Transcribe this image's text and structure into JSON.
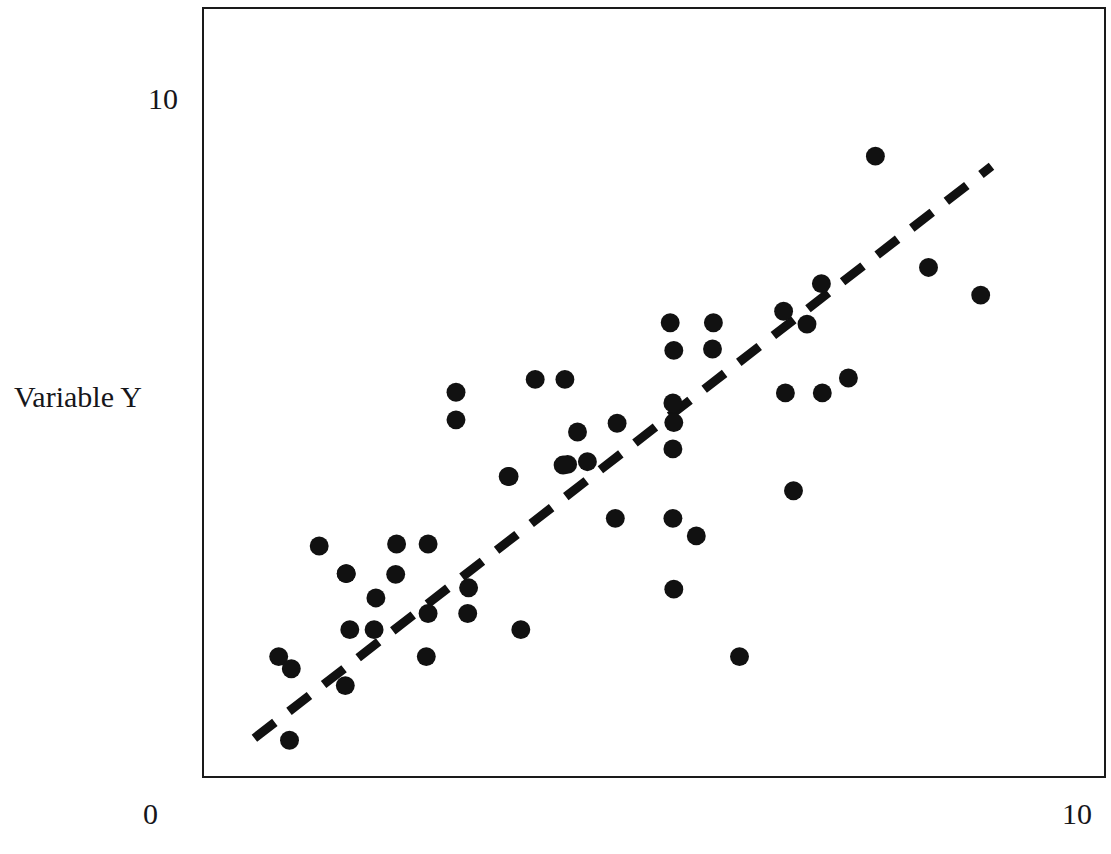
{
  "axes": {
    "y_label": "Variable Y",
    "y_tick_top": "10",
    "x_tick_left": "0",
    "x_tick_right": "10"
  },
  "style": {
    "point_color": "#111111",
    "line_color": "#111111",
    "frame_color": "#1a1a1a",
    "background": "#ffffff",
    "point_radius_px": 9.5,
    "trend_dash": "26 18",
    "trend_width_px": 9
  },
  "chart_data": {
    "type": "scatter",
    "title": "",
    "xlabel": "",
    "ylabel": "Variable Y",
    "xlim": [
      0,
      10
    ],
    "ylim": [
      0,
      10
    ],
    "xticks": [
      0,
      10
    ],
    "yticks": [
      10
    ],
    "grid": false,
    "legend": null,
    "frame": {
      "left_px": 202,
      "top_px": 7,
      "width_px": 904,
      "height_px": 771
    },
    "pixel_mapping": {
      "x0_px": 202,
      "x_per_unit_px": 90.4,
      "y0_px": 778,
      "y_per_unit_px": 67.8
    },
    "points": [
      {
        "x": 0.83,
        "y": 1.77
      },
      {
        "x": 0.97,
        "y": 1.59
      },
      {
        "x": 0.95,
        "y": 0.53
      },
      {
        "x": 1.28,
        "y": 3.41
      },
      {
        "x": 1.58,
        "y": 3.0
      },
      {
        "x": 1.91,
        "y": 2.64
      },
      {
        "x": 1.57,
        "y": 1.34
      },
      {
        "x": 1.62,
        "y": 2.17
      },
      {
        "x": 1.89,
        "y": 2.17
      },
      {
        "x": 1.58,
        "y": 3.0
      },
      {
        "x": 2.14,
        "y": 3.44
      },
      {
        "x": 2.49,
        "y": 3.44
      },
      {
        "x": 2.13,
        "y": 2.99
      },
      {
        "x": 2.49,
        "y": 2.41
      },
      {
        "x": 2.94,
        "y": 2.79
      },
      {
        "x": 2.93,
        "y": 2.41
      },
      {
        "x": 2.47,
        "y": 1.77
      },
      {
        "x": 3.52,
        "y": 2.17
      },
      {
        "x": 2.8,
        "y": 5.69
      },
      {
        "x": 2.8,
        "y": 5.28
      },
      {
        "x": 3.39,
        "y": 4.44
      },
      {
        "x": 3.68,
        "y": 5.88
      },
      {
        "x": 4.01,
        "y": 5.88
      },
      {
        "x": 4.15,
        "y": 5.1
      },
      {
        "x": 4.04,
        "y": 4.62
      },
      {
        "x": 4.26,
        "y": 4.66
      },
      {
        "x": 3.99,
        "y": 4.61
      },
      {
        "x": 3.38,
        "y": 4.44
      },
      {
        "x": 4.59,
        "y": 5.23
      },
      {
        "x": 5.18,
        "y": 6.72
      },
      {
        "x": 5.22,
        "y": 6.31
      },
      {
        "x": 5.66,
        "y": 6.72
      },
      {
        "x": 5.65,
        "y": 6.33
      },
      {
        "x": 5.21,
        "y": 5.53
      },
      {
        "x": 5.22,
        "y": 5.24
      },
      {
        "x": 5.21,
        "y": 4.85
      },
      {
        "x": 5.22,
        "y": 2.77
      },
      {
        "x": 4.57,
        "y": 3.82
      },
      {
        "x": 5.21,
        "y": 3.82
      },
      {
        "x": 5.47,
        "y": 3.56
      },
      {
        "x": 6.44,
        "y": 6.89
      },
      {
        "x": 6.7,
        "y": 6.7
      },
      {
        "x": 6.86,
        "y": 7.3
      },
      {
        "x": 7.46,
        "y": 9.19
      },
      {
        "x": 8.05,
        "y": 7.54
      },
      {
        "x": 8.63,
        "y": 7.13
      },
      {
        "x": 6.46,
        "y": 5.68
      },
      {
        "x": 6.87,
        "y": 5.68
      },
      {
        "x": 7.16,
        "y": 5.9
      },
      {
        "x": 6.55,
        "y": 4.23
      },
      {
        "x": 5.95,
        "y": 1.77
      }
    ],
    "trend_line": {
      "style": "dashed",
      "x_start": 0.56,
      "y_start": 0.56,
      "x_end": 8.75,
      "y_end": 9.04
    }
  }
}
